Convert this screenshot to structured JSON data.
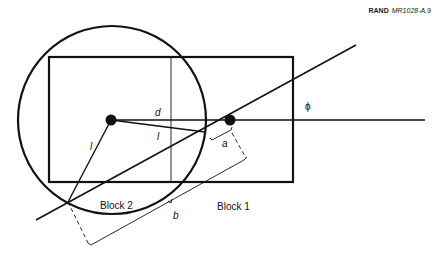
{
  "header": {
    "publisher": "RAND",
    "figure_id": "MR1028-A.9"
  },
  "diagram": {
    "labels": {
      "d": "d",
      "l_upper": "l",
      "l_left": "l",
      "a": "a",
      "b": "b",
      "phi": "ϕ",
      "block1": "Block 1",
      "block2": "Block 2"
    },
    "colors": {
      "stroke": "#111111",
      "background": "#ffffff"
    },
    "geometry": {
      "rectangle": {
        "x": 49,
        "y": 57,
        "width": 244,
        "height": 125
      },
      "circle": {
        "cx": 112,
        "cy": 120,
        "r": 94
      },
      "left_point": {
        "x": 111,
        "y": 120
      },
      "right_point": {
        "x": 230,
        "y": 120
      },
      "intersection_point": {
        "x": 68,
        "y": 202
      }
    }
  }
}
